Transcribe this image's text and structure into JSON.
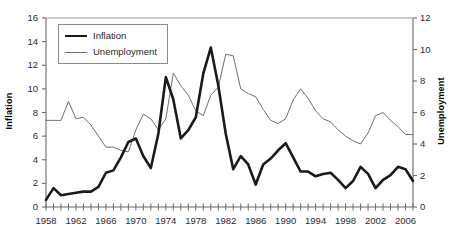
{
  "chart_data": {
    "type": "line",
    "title": "",
    "xlabel": "",
    "ylabel": "Inflation",
    "y2label": "Unemployment",
    "grid": false,
    "legend_position": "top-left",
    "xlim": [
      1958,
      2007
    ],
    "ylim": [
      0,
      16
    ],
    "y2lim": [
      0,
      12
    ],
    "x": [
      1958,
      1959,
      1960,
      1961,
      1962,
      1963,
      1964,
      1965,
      1966,
      1967,
      1968,
      1969,
      1970,
      1971,
      1972,
      1973,
      1974,
      1975,
      1976,
      1977,
      1978,
      1979,
      1980,
      1981,
      1982,
      1983,
      1984,
      1985,
      1986,
      1987,
      1988,
      1989,
      1990,
      1991,
      1992,
      1993,
      1994,
      1995,
      1996,
      1997,
      1998,
      1999,
      2000,
      2001,
      2002,
      2003,
      2004,
      2005,
      2006,
      2007
    ],
    "xticks_labeled": [
      1958,
      1962,
      1966,
      1970,
      1974,
      1978,
      1982,
      1986,
      1990,
      1994,
      1998,
      2002,
      2006
    ],
    "yticks_left": [
      0,
      2,
      4,
      6,
      8,
      10,
      12,
      14,
      16
    ],
    "yticks_right": [
      0,
      2,
      4,
      6,
      8,
      10,
      12
    ],
    "series": [
      {
        "name": "Inflation",
        "axis": "left",
        "color": "#1a1a1a",
        "width": 2.6,
        "values": [
          0.6,
          1.6,
          1.0,
          1.1,
          1.2,
          1.3,
          1.3,
          1.7,
          2.9,
          3.1,
          4.2,
          5.5,
          5.8,
          4.3,
          3.3,
          6.2,
          11.0,
          9.1,
          5.8,
          6.5,
          7.6,
          11.3,
          13.5,
          10.3,
          6.2,
          3.2,
          4.3,
          3.6,
          1.9,
          3.6,
          4.1,
          4.8,
          5.4,
          4.2,
          3.0,
          3.0,
          2.6,
          2.8,
          2.9,
          2.3,
          1.6,
          2.2,
          3.4,
          2.8,
          1.6,
          2.3,
          2.7,
          3.4,
          3.2,
          2.2
        ]
      },
      {
        "name": "Unemployment",
        "axis": "right",
        "color": "#6f6f6f",
        "width": 1,
        "values": [
          5.5,
          5.5,
          5.5,
          6.7,
          5.6,
          5.7,
          5.2,
          4.5,
          3.8,
          3.8,
          3.6,
          3.5,
          4.9,
          5.9,
          5.6,
          4.9,
          5.6,
          8.5,
          7.7,
          7.1,
          6.1,
          5.8,
          7.1,
          7.6,
          9.7,
          9.6,
          7.5,
          7.2,
          7.0,
          6.2,
          5.5,
          5.3,
          5.6,
          6.8,
          7.5,
          6.9,
          6.1,
          5.6,
          5.4,
          4.9,
          4.5,
          4.2,
          4.0,
          4.7,
          5.8,
          6.0,
          5.5,
          5.1,
          4.6,
          4.6
        ]
      }
    ]
  },
  "legend": {
    "items": [
      {
        "label": "Inflation"
      },
      {
        "label": "Unemployment"
      }
    ]
  },
  "axes": {
    "left_title": "Inflation",
    "right_title": "Unemployment"
  }
}
